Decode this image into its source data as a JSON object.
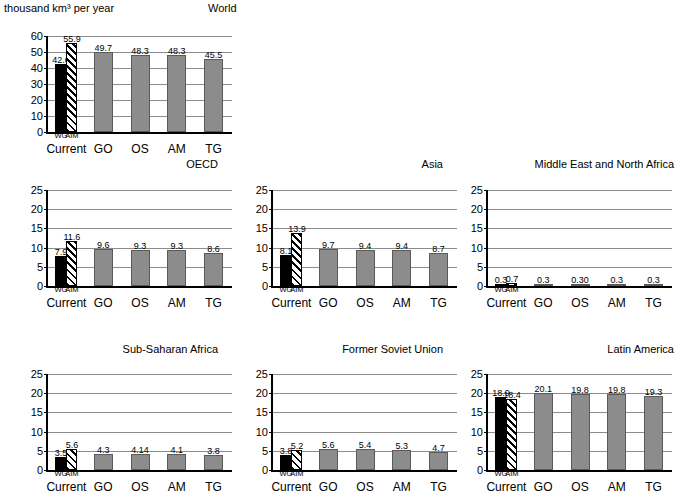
{
  "unit_label": "thousand km³ per year",
  "scenario_labels": [
    "Current",
    "GO",
    "OS",
    "AM",
    "TG"
  ],
  "current_sub_labels": [
    "WG",
    "AIM"
  ],
  "colors": {
    "bar_gray": "#8c8c8c",
    "bar_black": "#000000",
    "gridline": "#8c8c8c",
    "axis": "#000000"
  },
  "chart_data": [
    {
      "type": "bar",
      "title": "World",
      "xlabel": "",
      "ylabel": "thousand km³ per year",
      "ylim": [
        0,
        60
      ],
      "yticks": [
        0,
        10,
        20,
        30,
        40,
        50,
        60
      ],
      "grid": true,
      "legend": "none",
      "categories": [
        "WG",
        "AIM",
        "GO",
        "OS",
        "AM",
        "TG"
      ],
      "group_labels": [
        "Current",
        "GO",
        "OS",
        "AM",
        "TG"
      ],
      "values": [
        42.6,
        55.9,
        49.7,
        48.3,
        48.3,
        45.5
      ],
      "value_labels": [
        "42.6",
        "55.9",
        "49.7",
        "48.3",
        "48.3",
        "45.5"
      ],
      "styles": [
        "black",
        "hatch",
        "gray",
        "gray",
        "gray",
        "gray"
      ]
    },
    {
      "type": "bar",
      "title": "OECD",
      "xlabel": "",
      "ylabel": "",
      "ylim": [
        0,
        25
      ],
      "yticks": [
        0,
        5,
        10,
        15,
        20,
        25
      ],
      "grid": true,
      "legend": "none",
      "categories": [
        "WG",
        "AIM",
        "GO",
        "OS",
        "AM",
        "TG"
      ],
      "group_labels": [
        "Current",
        "GO",
        "OS",
        "AM",
        "TG"
      ],
      "values": [
        7.9,
        11.6,
        9.6,
        9.3,
        9.3,
        8.6
      ],
      "value_labels": [
        "7.9",
        "11.6",
        "9.6",
        "9.3",
        "9.3",
        "8.6"
      ],
      "styles": [
        "black",
        "hatch",
        "gray",
        "gray",
        "gray",
        "gray"
      ]
    },
    {
      "type": "bar",
      "title": "Asia",
      "xlabel": "",
      "ylabel": "",
      "ylim": [
        0,
        25
      ],
      "yticks": [
        0,
        5,
        10,
        15,
        20,
        25
      ],
      "grid": true,
      "legend": "none",
      "categories": [
        "WG",
        "AIM",
        "GO",
        "OS",
        "AM",
        "TG"
      ],
      "group_labels": [
        "Current",
        "GO",
        "OS",
        "AM",
        "TG"
      ],
      "values": [
        8.1,
        13.9,
        9.7,
        9.4,
        9.4,
        8.7
      ],
      "value_labels": [
        "8.1",
        "13.9",
        "9.7",
        "9.4",
        "9.4",
        "8.7"
      ],
      "styles": [
        "black",
        "hatch",
        "gray",
        "gray",
        "gray",
        "gray"
      ]
    },
    {
      "type": "bar",
      "title": "Middle East and North Africa",
      "xlabel": "",
      "ylabel": "",
      "ylim": [
        0,
        25
      ],
      "yticks": [
        0,
        5,
        10,
        15,
        20,
        25
      ],
      "grid": true,
      "legend": "none",
      "categories": [
        "WG",
        "AIM",
        "GO",
        "OS",
        "AM",
        "TG"
      ],
      "group_labels": [
        "Current",
        "GO",
        "OS",
        "AM",
        "TG"
      ],
      "values": [
        0.3,
        0.7,
        0.3,
        0.3,
        0.3,
        0.3
      ],
      "value_labels": [
        "0.3",
        "0.7",
        "0.3",
        "0.30",
        "0.3",
        "0.3"
      ],
      "styles": [
        "black",
        "hatch",
        "gray",
        "gray",
        "gray",
        "gray"
      ]
    },
    {
      "type": "bar",
      "title": "Sub-Saharan Africa",
      "xlabel": "",
      "ylabel": "",
      "ylim": [
        0,
        25
      ],
      "yticks": [
        0,
        5,
        10,
        15,
        20,
        25
      ],
      "grid": true,
      "legend": "none",
      "categories": [
        "WG",
        "AIM",
        "GO",
        "OS",
        "AM",
        "TG"
      ],
      "group_labels": [
        "Current",
        "GO",
        "OS",
        "AM",
        "TG"
      ],
      "values": [
        3.5,
        5.6,
        4.3,
        4.14,
        4.1,
        3.8
      ],
      "value_labels": [
        "3.5",
        "5.6",
        "4.3",
        "4.14",
        "4.1",
        "3.8"
      ],
      "styles": [
        "black",
        "hatch",
        "gray",
        "gray",
        "gray",
        "gray"
      ]
    },
    {
      "type": "bar",
      "title": "Former Soviet Union",
      "xlabel": "",
      "ylabel": "",
      "ylim": [
        0,
        25
      ],
      "yticks": [
        0,
        5,
        10,
        15,
        20,
        25
      ],
      "grid": true,
      "legend": "none",
      "categories": [
        "WG",
        "AIM",
        "GO",
        "OS",
        "AM",
        "TG"
      ],
      "group_labels": [
        "Current",
        "GO",
        "OS",
        "AM",
        "TG"
      ],
      "values": [
        3.8,
        5.2,
        5.6,
        5.4,
        5.3,
        4.7
      ],
      "value_labels": [
        "3.8",
        "5.2",
        "5.6",
        "5.4",
        "5.3",
        "4.7"
      ],
      "styles": [
        "black",
        "hatch",
        "gray",
        "gray",
        "gray",
        "gray"
      ]
    },
    {
      "type": "bar",
      "title": "Latin America",
      "xlabel": "",
      "ylabel": "",
      "ylim": [
        0,
        25
      ],
      "yticks": [
        0,
        5,
        10,
        15,
        20,
        25
      ],
      "grid": true,
      "legend": "none",
      "categories": [
        "WG",
        "AIM",
        "GO",
        "OS",
        "AM",
        "TG"
      ],
      "group_labels": [
        "Current",
        "GO",
        "OS",
        "AM",
        "TG"
      ],
      "values": [
        18.9,
        18.4,
        20.1,
        19.8,
        19.8,
        19.3
      ],
      "value_labels": [
        "18.9",
        "18.4",
        "20.1",
        "19.8",
        "19.8",
        "19.3"
      ],
      "styles": [
        "black",
        "hatch",
        "gray",
        "gray",
        "gray",
        "gray"
      ]
    }
  ]
}
